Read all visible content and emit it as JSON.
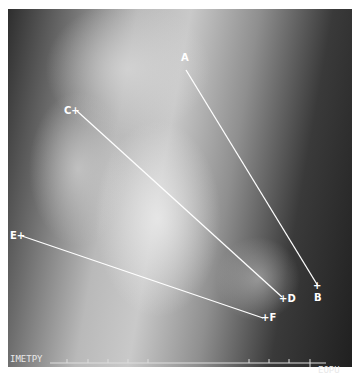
{
  "image": {
    "description": "Radiograph with overlaid measurement lines",
    "colors": {
      "line": "#ffffff",
      "label": "#ffffff"
    }
  },
  "markers": {
    "A": {
      "label": "A",
      "x": 186,
      "y": 58
    },
    "B": {
      "label": "B",
      "x": 318,
      "y": 297
    },
    "C": {
      "label": "C+",
      "x": 66,
      "y": 106
    },
    "D": {
      "label": "+D",
      "x": 279,
      "y": 294
    },
    "E": {
      "label": "E+",
      "x": 11,
      "y": 231
    },
    "F": {
      "label": "+F",
      "x": 261,
      "y": 313
    }
  },
  "lines": [
    {
      "name": "line-a-b",
      "from": [
        186,
        70
      ],
      "to": [
        318,
        286
      ]
    },
    {
      "name": "line-c-d",
      "from": [
        77,
        111
      ],
      "to": [
        282,
        297
      ]
    },
    {
      "name": "line-e-f",
      "from": [
        22,
        236
      ],
      "to": [
        263,
        318
      ]
    }
  ],
  "ruler": {
    "left_label": "IMETPY",
    "right_label": "EOPU",
    "ticks_x": [
      67,
      88,
      108,
      128,
      148,
      249,
      269,
      289,
      310
    ]
  }
}
